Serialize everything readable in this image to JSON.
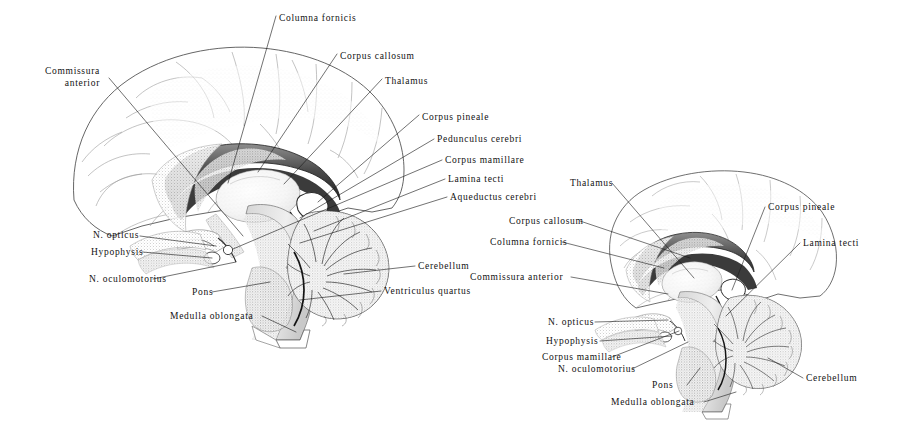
{
  "plate": {
    "background_color": "#ffffff",
    "ink_color": "#1a1a1a",
    "illustration_style": "stippled-engraving",
    "figures": [
      {
        "id": "left-figure",
        "name": "median-sagittal-section-of-brain-large",
        "description": "Large median sagittal section of the human brain"
      },
      {
        "id": "right-figure",
        "name": "median-sagittal-section-of-brain-small",
        "description": "Smaller median sagittal section of the human brain"
      }
    ]
  },
  "left_figure": {
    "labels": [
      {
        "id": "l-columna-fornicis",
        "text": "Columna fornicis",
        "x": 279,
        "y": 13,
        "align": "left",
        "lines": [
          "Columna fornicis"
        ]
      },
      {
        "id": "l-corpus-callosum",
        "text": "Corpus callosum",
        "x": 340,
        "y": 51,
        "align": "left",
        "lines": [
          "Corpus callosum"
        ]
      },
      {
        "id": "l-thalamus",
        "text": "Thalamus",
        "x": 385,
        "y": 76,
        "align": "left",
        "lines": [
          "Thalamus"
        ]
      },
      {
        "id": "l-corpus-pineale",
        "text": "Corpus pineale",
        "x": 422,
        "y": 112,
        "align": "left",
        "lines": [
          "Corpus pineale"
        ]
      },
      {
        "id": "l-pedunculus-cerebri",
        "text": "Pedunculus cerebri",
        "x": 437,
        "y": 136,
        "align": "left",
        "lines": [
          "Pedunculus cerebri"
        ]
      },
      {
        "id": "l-corpus-mamillare",
        "text": "Corpus mamillare",
        "x": 445,
        "y": 157,
        "align": "left",
        "lines": [
          "Corpus mamillare"
        ]
      },
      {
        "id": "l-lamina-tecti",
        "text": "Lamina tecti",
        "x": 448,
        "y": 176,
        "align": "left",
        "lines": [
          "Lamina tecti"
        ]
      },
      {
        "id": "l-aqueductus-cerebri",
        "text": "Aqueductus cerebri",
        "x": 450,
        "y": 194,
        "align": "left",
        "lines": [
          "Aqueductus cerebri"
        ]
      },
      {
        "id": "l-commissura-anterior",
        "text": "Commissura anterior",
        "x": 50,
        "y": 66,
        "align": "right",
        "lines": [
          "Commissura",
          "anterior"
        ]
      },
      {
        "id": "l-n-opticus",
        "text": "N. opticus",
        "x": 93,
        "y": 232,
        "align": "left",
        "lines": [
          "N. opticus"
        ]
      },
      {
        "id": "l-hypophysis",
        "text": "Hypophysis",
        "x": 91,
        "y": 249,
        "align": "left",
        "lines": [
          "Hypophysis"
        ]
      },
      {
        "id": "l-n-oculomotorius",
        "text": "N. oculomotorius",
        "x": 89,
        "y": 276,
        "align": "left",
        "lines": [
          "N. oculomotorius"
        ]
      },
      {
        "id": "l-pons",
        "text": "Pons",
        "x": 192,
        "y": 290,
        "align": "left",
        "lines": [
          "Pons"
        ]
      },
      {
        "id": "l-medulla-oblongata",
        "text": "Medulla oblongata",
        "x": 170,
        "y": 313,
        "align": "left",
        "lines": [
          "Medulla oblongata"
        ]
      },
      {
        "id": "l-cerebellum",
        "text": "Cerebellum",
        "x": 418,
        "y": 263,
        "align": "left",
        "lines": [
          "Cerebellum"
        ]
      },
      {
        "id": "l-ventriculus-quartus",
        "text": "Ventriculus quartus",
        "x": 384,
        "y": 288,
        "align": "left",
        "lines": [
          "Ventriculus quartus"
        ]
      }
    ]
  },
  "right_figure": {
    "labels": [
      {
        "id": "r-thalamus",
        "text": "Thalamus",
        "x": 570,
        "y": 180,
        "align": "left",
        "lines": [
          "Thalamus"
        ]
      },
      {
        "id": "r-corpus-callosum",
        "text": "Corpus callosum",
        "x": 509,
        "y": 218,
        "align": "left",
        "lines": [
          "Corpus callosum"
        ]
      },
      {
        "id": "r-columna-fornicis",
        "text": "Columna fornicis",
        "x": 490,
        "y": 239,
        "align": "left",
        "lines": [
          "Columna fornicis"
        ]
      },
      {
        "id": "r-commissura-anterior",
        "text": "Commissura anterior",
        "x": 470,
        "y": 274,
        "align": "left",
        "lines": [
          "Commissura anterior"
        ]
      },
      {
        "id": "r-corpus-pineale",
        "text": "Corpus pineale",
        "x": 768,
        "y": 204,
        "align": "left",
        "lines": [
          "Corpus pineale"
        ]
      },
      {
        "id": "r-lamina-tecti",
        "text": "Lamina tecti",
        "x": 803,
        "y": 240,
        "align": "left",
        "lines": [
          "Lamina tecti"
        ]
      },
      {
        "id": "r-n-opticus",
        "text": "N. opticus",
        "x": 548,
        "y": 319,
        "align": "left",
        "lines": [
          "N. opticus"
        ]
      },
      {
        "id": "r-hypophysis",
        "text": "Hypophysis",
        "x": 546,
        "y": 338,
        "align": "left",
        "lines": [
          "Hypophysis"
        ]
      },
      {
        "id": "r-corpus-mamillare",
        "text": "Corpus mamillare",
        "x": 542,
        "y": 354,
        "align": "left",
        "lines": [
          "Corpus mamillare"
        ]
      },
      {
        "id": "r-n-oculomotorius",
        "text": "N. oculomotorius",
        "x": 558,
        "y": 366,
        "align": "left",
        "lines": [
          "N. oculomotorius"
        ]
      },
      {
        "id": "r-pons",
        "text": "Pons",
        "x": 652,
        "y": 382,
        "align": "left",
        "lines": [
          "Pons"
        ]
      },
      {
        "id": "r-medulla-oblongata",
        "text": "Medulla oblongata",
        "x": 611,
        "y": 399,
        "align": "left",
        "lines": [
          "Medulla oblongata"
        ]
      },
      {
        "id": "r-cerebellum",
        "text": "Cerebellum",
        "x": 806,
        "y": 375,
        "align": "left",
        "lines": [
          "Cerebellum"
        ]
      }
    ]
  }
}
